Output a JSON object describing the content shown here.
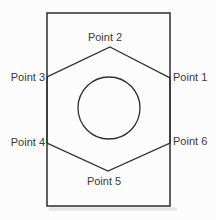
{
  "diagram": {
    "points": [
      {
        "label": "Point 1"
      },
      {
        "label": "Point 2"
      },
      {
        "label": "Point 3"
      },
      {
        "label": "Point 4"
      },
      {
        "label": "Point 5"
      },
      {
        "label": "Point 6"
      }
    ],
    "colors": {
      "stroke": "#2e2e2e",
      "text": "#3a3a3a",
      "background": "#fcfcfc",
      "shadow": "#cfcfcf"
    }
  }
}
